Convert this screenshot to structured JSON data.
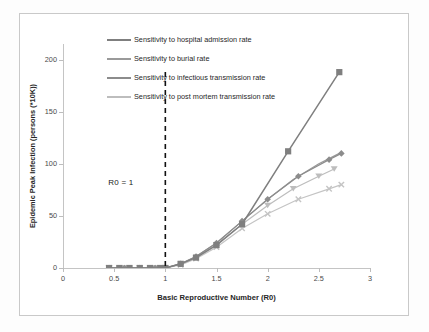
{
  "chart_data": {
    "type": "line",
    "title": "",
    "xlabel": "Basic Reproductive Number (R0)",
    "ylabel": "Epidemic Peak Infection (persons (*10K))",
    "xlim": [
      0,
      3
    ],
    "ylim": [
      0,
      215
    ],
    "xticks": [
      "0",
      "0.5",
      "1",
      "1.5",
      "2",
      "2.5",
      "3"
    ],
    "xtick_values": [
      0,
      0.5,
      1,
      1.5,
      2,
      2.5,
      3
    ],
    "yticks": [
      "0",
      "50",
      "100",
      "150",
      "200"
    ],
    "ytick_values": [
      0,
      50,
      100,
      150,
      200
    ],
    "grid": false,
    "legend_position": "upper-left-inside",
    "annotations": [
      {
        "text": "R0 = 1",
        "x": 1,
        "note": "vertical dashed threshold line at R0 = 1"
      }
    ],
    "series": [
      {
        "name": "Sensitivity to hospital admission rate",
        "color": "#7f7f7f",
        "marker": "square",
        "x": [
          0.45,
          0.55,
          0.65,
          0.75,
          0.85,
          0.95,
          1.0,
          1.15,
          1.3,
          1.5,
          1.75,
          2.2,
          2.7
        ],
        "values": [
          0,
          0,
          0,
          0,
          0,
          0,
          0,
          4,
          10,
          22,
          42,
          112,
          188
        ]
      },
      {
        "name": "Sensitivity to burial rate",
        "color": "#9a9a9a",
        "marker": "none",
        "x": [
          0.45,
          0.6,
          0.75,
          0.9,
          1.0,
          1.15,
          1.3,
          1.5,
          1.75,
          2.0,
          2.25,
          2.5,
          2.7
        ],
        "values": [
          0,
          0,
          0,
          0,
          0,
          4,
          11,
          24,
          45,
          66,
          85,
          100,
          110
        ]
      },
      {
        "name": "Sensitivity to infectious transmission rate",
        "color": "#8c8c8c",
        "marker": "diamond",
        "x": [
          0.45,
          0.6,
          0.75,
          0.9,
          1.0,
          1.15,
          1.3,
          1.5,
          1.75,
          2.0,
          2.3,
          2.6,
          2.72
        ],
        "values": [
          0,
          0,
          0,
          0,
          0,
          4,
          11,
          24,
          45,
          66,
          88,
          104,
          110
        ]
      },
      {
        "name": "Sensitivity to post mortem transmission rate",
        "color": "#bdbdbd",
        "marker": "triangle",
        "x": [
          0.45,
          0.6,
          0.75,
          0.9,
          1.0,
          1.15,
          1.3,
          1.5,
          1.75,
          2.0,
          2.25,
          2.5,
          2.65
        ],
        "values": [
          0,
          0,
          0,
          0,
          0,
          4,
          10,
          22,
          42,
          60,
          76,
          88,
          95
        ]
      },
      {
        "name": "Sensitivity to post mortem transmission rate (lower branch)",
        "color": "#c4c4c4",
        "marker": "cross",
        "x": [
          0.45,
          0.6,
          0.75,
          0.9,
          1.0,
          1.15,
          1.3,
          1.5,
          1.75,
          2.0,
          2.3,
          2.6,
          2.72
        ],
        "values": [
          0,
          0,
          0,
          0,
          0,
          3,
          9,
          20,
          38,
          52,
          66,
          76,
          80
        ]
      }
    ],
    "legend": [
      {
        "label": "Sensitivity to hospital admission rate",
        "color": "#7f7f7f",
        "marker": "square"
      },
      {
        "label": "Sensitivity to burial rate",
        "color": "#9a9a9a",
        "marker": "none"
      },
      {
        "label": "Sensitivity to infectious transmission rate",
        "color": "#8c8c8c",
        "marker": "diamond"
      },
      {
        "label": "Sensitivity to post mortem transmission rate",
        "color": "#bdbdbd",
        "marker": "triangle"
      }
    ]
  }
}
